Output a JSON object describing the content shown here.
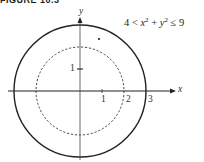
{
  "figure": {
    "caption": "FIGURE 10.3",
    "inequality": {
      "left": "4 <",
      "term1_var": "x",
      "term1_exp": "2",
      "plus": "+",
      "term2_var": "y",
      "term2_exp": "2",
      "right": "≤ 9"
    },
    "axes": {
      "x_label": "x",
      "y_label": "y",
      "x_ticks": [
        "1",
        "2",
        "3"
      ],
      "y_ticks": [
        "1"
      ]
    },
    "regions": {
      "outer_circle": {
        "radius": 3,
        "style": "solid"
      },
      "inner_circle": {
        "radius": 2,
        "style": "dashed"
      }
    },
    "colors": {
      "stroke": "#222222",
      "axis": "#333333",
      "background": "#ffffff"
    }
  }
}
